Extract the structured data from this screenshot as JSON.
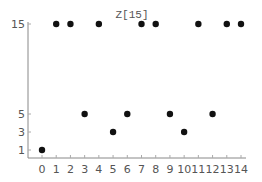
{
  "chart_data": {
    "type": "scatter",
    "title": "Z[15]",
    "xlabel": "",
    "ylabel": "",
    "x": [
      0,
      1,
      2,
      3,
      4,
      5,
      6,
      7,
      8,
      9,
      10,
      11,
      12,
      13,
      14
    ],
    "y": [
      1,
      15,
      15,
      5,
      15,
      3,
      5,
      15,
      15,
      5,
      3,
      15,
      5,
      15,
      15
    ],
    "x_ticks": [
      0,
      1,
      2,
      3,
      4,
      5,
      6,
      7,
      8,
      9,
      10,
      11,
      12,
      13,
      14
    ],
    "y_ticks": [
      1,
      3,
      5,
      15
    ],
    "xlim": [
      0,
      14
    ],
    "ylim": [
      0,
      15
    ],
    "grid": false,
    "legend": "none",
    "colors": {
      "point": "#111111",
      "axis": "#888888",
      "text": "#555555"
    }
  }
}
